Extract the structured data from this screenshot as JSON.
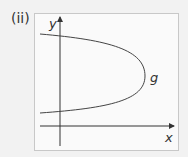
{
  "part_label": "(ii)",
  "axes": {
    "x_label": "x",
    "y_label": "y"
  },
  "curve_label": "g",
  "colors": {
    "axis": "#333333",
    "curve": "#444444",
    "border": "#c8c8c8",
    "background": "#f2f2f2"
  }
}
